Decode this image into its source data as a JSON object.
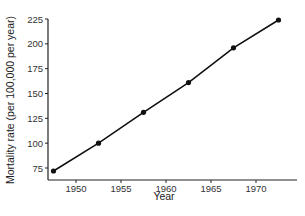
{
  "chart_data": {
    "type": "line",
    "title": "",
    "xlabel": "Year",
    "ylabel": "Mortality rate (per 100,000 per year)",
    "x": [
      1947.5,
      1952.5,
      1957.5,
      1962.5,
      1967.5,
      1972.5
    ],
    "series": [
      {
        "name": "Mortality rate",
        "values": [
          72,
          100,
          131,
          161,
          196,
          224
        ]
      }
    ],
    "xticks": [
      1950,
      1955,
      1960,
      1965,
      1970
    ],
    "yticks": [
      75,
      100,
      125,
      150,
      175,
      200,
      225
    ],
    "xlim": [
      1945.5,
      1974.5
    ],
    "ylim": [
      64,
      225
    ],
    "grid": false,
    "legend": "none",
    "markers": "filled-circle",
    "colors": {
      "line": "#111111",
      "axis": "#222222"
    }
  }
}
